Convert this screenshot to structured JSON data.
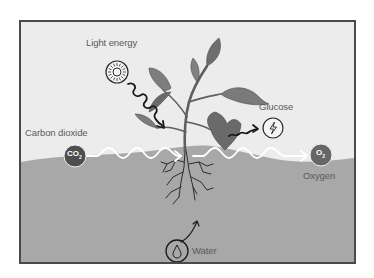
{
  "diagram": {
    "type": "photosynthesis",
    "colors": {
      "sky": "#ececec",
      "ground": "#a8a8a8",
      "frame": "#4a4a4a",
      "leaf": "#7c7c7c",
      "leaf_dark": "#5c5c5c",
      "stem": "#6a6a6a",
      "molecule": "#4e4e4e",
      "arrow_white": "#ffffff",
      "arrow_black": "#1a1a1a",
      "text": "#5a5a5a"
    },
    "labels": {
      "light": "Light energy",
      "glucose": "Glucose",
      "carbon_dioxide": "Carbon dioxide",
      "oxygen": "Oxygen",
      "water": "Water"
    },
    "molecules": {
      "co2": "CO",
      "co2_sub": "2",
      "o2": "O",
      "o2_sub": "2"
    },
    "icons": {
      "light": "sun-icon",
      "glucose": "lightning-bolt-icon",
      "water": "water-drop-icon"
    }
  }
}
